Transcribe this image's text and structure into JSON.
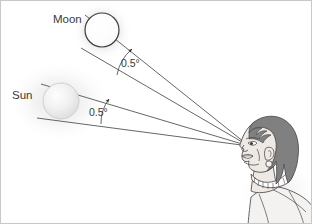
{
  "figure": {
    "background_color": "#ffffff",
    "border_color": "#c8c8c8",
    "ink_color": "#4a4a4a",
    "text_color": "#3a3a3a"
  },
  "labels": {
    "moon": "Moon",
    "sun": "Sun",
    "moon_angle": "0.5°",
    "sun_angle": "0.5°"
  },
  "bodies": {
    "moon": {
      "name": "Moon",
      "center_x": 101,
      "center_y": 29,
      "radius": 17,
      "fill": "#ffffff",
      "outline": "#3c3c3c",
      "glow": "#d8d8d8"
    },
    "sun": {
      "name": "Sun",
      "center_x": 60,
      "center_y": 100,
      "radius": 18,
      "fill": "#f2f2f2",
      "outline": "#d2d2d2",
      "glow": "#dcdcdc"
    }
  },
  "observer": {
    "name": "observer-head",
    "eye_x": 248,
    "eye_y": 145,
    "hair_color": "#808080",
    "skin_color": "#efe9e4",
    "outline_color": "#4a4a4a",
    "shirt_color": "#f4f2f0"
  },
  "angles": {
    "moon_degrees": 0.5,
    "sun_degrees": 0.5,
    "unit": "degrees"
  },
  "sight_lines": [
    {
      "name": "moon-upper-ray",
      "from_x": 84,
      "from_y": 14,
      "to_x": 248,
      "to_y": 145
    },
    {
      "name": "moon-lower-ray",
      "from_x": 80,
      "from_y": 47,
      "to_x": 248,
      "to_y": 145
    },
    {
      "name": "sun-upper-ray",
      "from_x": 40,
      "from_y": 83,
      "to_x": 248,
      "to_y": 145
    },
    {
      "name": "sun-lower-ray",
      "from_x": 36,
      "from_y": 117,
      "to_x": 248,
      "to_y": 145
    }
  ]
}
